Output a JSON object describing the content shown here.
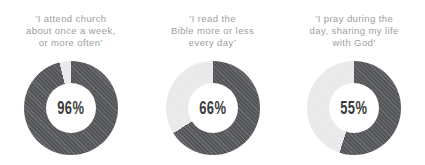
{
  "colors": {
    "ring_filled": "#54565a",
    "ring_empty": "#e9e9ea",
    "label_text": "#9c9ea1",
    "value_text": "#3a3a3c"
  },
  "chart_data": [
    {
      "type": "pie",
      "subtype": "donut",
      "title": "’I attend church about once a week, or more often’",
      "title_lines": [
        "’I attend church",
        "about once a week,",
        "or more often’"
      ],
      "value_pct": 96,
      "value_label": "96%",
      "slices": [
        {
          "name": "agree",
          "value": 96,
          "color": "#54565a"
        },
        {
          "name": "remainder",
          "value": 4,
          "color": "#e9e9ea"
        }
      ],
      "start_angle_deg": 0,
      "direction": "clockwise"
    },
    {
      "type": "pie",
      "subtype": "donut",
      "title": "’I read the Bible more or less every day’",
      "title_lines": [
        "’I read the",
        "Bible more or less",
        "every day’"
      ],
      "value_pct": 66,
      "value_label": "66%",
      "slices": [
        {
          "name": "agree",
          "value": 66,
          "color": "#54565a"
        },
        {
          "name": "remainder",
          "value": 34,
          "color": "#e9e9ea"
        }
      ],
      "start_angle_deg": 0,
      "direction": "clockwise"
    },
    {
      "type": "pie",
      "subtype": "donut",
      "title": "’I pray during the day, sharing my life with God’",
      "title_lines": [
        "’I pray during the",
        "day, sharing my life",
        "with God’"
      ],
      "value_pct": 55,
      "value_label": "55%",
      "slices": [
        {
          "name": "agree",
          "value": 55,
          "color": "#54565a"
        },
        {
          "name": "remainder",
          "value": 45,
          "color": "#e9e9ea"
        }
      ],
      "start_angle_deg": 0,
      "direction": "clockwise"
    }
  ]
}
